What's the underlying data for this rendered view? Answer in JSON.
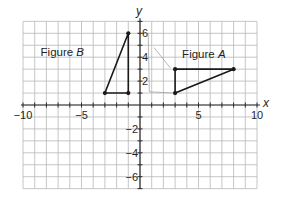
{
  "diagram": {
    "type": "coordinate-plane",
    "x_axis": {
      "name": "x",
      "min": -10,
      "max": 10,
      "grid_step": 1,
      "tick_labels": [
        {
          "value": -10,
          "text": "−10"
        },
        {
          "value": -5,
          "text": "−5"
        },
        {
          "value": 5,
          "text": "5"
        },
        {
          "value": 10,
          "text": "10"
        }
      ]
    },
    "y_axis": {
      "name": "y",
      "min": -7,
      "max": 7,
      "grid_step": 1,
      "tick_labels": [
        {
          "value": 6,
          "text": "6"
        },
        {
          "value": 4,
          "text": "4"
        },
        {
          "value": 2,
          "text": "2"
        },
        {
          "value": -2,
          "text": "−2"
        },
        {
          "value": -4,
          "text": "−4"
        },
        {
          "value": -6,
          "text": "−6"
        }
      ]
    },
    "figures": [
      {
        "id": "figure-a",
        "label_prefix": "Figure ",
        "label_letter": "A",
        "vertices": [
          [
            3,
            1
          ],
          [
            3,
            3
          ],
          [
            8,
            3
          ]
        ],
        "color": "#1a1a1a"
      },
      {
        "id": "figure-b",
        "label_prefix": "Figure ",
        "label_letter": "B",
        "vertices": [
          [
            -3,
            1
          ],
          [
            -1,
            1
          ],
          [
            -1,
            6
          ]
        ],
        "color": "#1a1a1a"
      }
    ],
    "faint_trace": {
      "points": [
        [
          0.7,
          6.0
        ],
        [
          0.8,
          1.1
        ],
        [
          3,
          1
        ]
      ],
      "extra": [
        [
          1.2,
          4.8
        ],
        [
          2.6,
          3.1
        ]
      ],
      "color": "#9a9a9a"
    },
    "colors": {
      "grid": "#b8b8b8",
      "axis": "#2a2a2a",
      "background": "#ffffff"
    }
  }
}
